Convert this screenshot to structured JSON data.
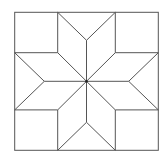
{
  "diagram": {
    "title": "",
    "stroke_color": "#555555",
    "background": "#ffffff",
    "outer_square": {
      "x1": 14.7,
      "y1": 12.3,
      "x2": 158.3,
      "y2": 150.3
    },
    "center": {
      "x": 86.5,
      "y": 81.3
    },
    "corner_square_size": {
      "w": 43,
      "h": 40.4
    },
    "star_points": 8,
    "corner_squares": 4,
    "side_triangles": 4
  }
}
